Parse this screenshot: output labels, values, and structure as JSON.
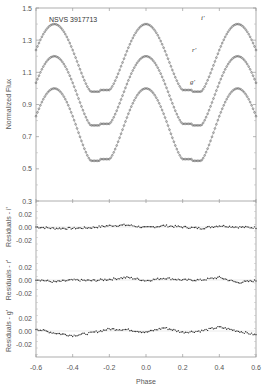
{
  "chart_data": {
    "type": "scatter",
    "annotation": "NSVS 3917713",
    "xlabel": "Phase",
    "xlim": [
      -0.6,
      0.6
    ],
    "xticks": [
      "-0.6",
      "-0.4",
      "-0.2",
      "0.0",
      "0.2",
      "0.4",
      "0.6"
    ],
    "panels": [
      {
        "name": "light-curves",
        "ylabel": "Normalized Flux",
        "ylim": [
          0.3,
          1.5
        ],
        "yticks": [
          "1.5",
          "1.3",
          "1.1",
          "0.9",
          "0.7",
          "0.5",
          "0.3"
        ],
        "series": [
          {
            "name": "i'",
            "label": "i'",
            "max_flux": 1.4,
            "min_flux_primary": 0.99,
            "min_flux_secondary": 0.98
          },
          {
            "name": "r'",
            "label": "r'",
            "max_flux": 1.2,
            "min_flux_primary": 0.78,
            "min_flux_secondary": 0.77
          },
          {
            "name": "g'",
            "label": "g'",
            "max_flux": 1.0,
            "min_flux_primary": 0.56,
            "min_flux_secondary": 0.55
          }
        ]
      },
      {
        "name": "residuals-i",
        "ylabel": "Residuals - i'",
        "yticks": [
          "0.02",
          "0.00",
          "-0.02"
        ],
        "x": [
          -0.6,
          -0.5,
          -0.4,
          -0.3,
          -0.2,
          -0.1,
          0.0,
          0.1,
          0.2,
          0.3,
          0.4,
          0.5,
          0.6
        ],
        "values": [
          0.0,
          -0.002,
          -0.002,
          -0.001,
          0.002,
          0.003,
          -0.001,
          0.002,
          0.0,
          -0.002,
          0.002,
          0.0,
          -0.001
        ]
      },
      {
        "name": "residuals-r",
        "ylabel": "Residuals - r'",
        "yticks": [
          "0.02",
          "0.00",
          "-0.02"
        ],
        "x": [
          -0.6,
          -0.5,
          -0.4,
          -0.3,
          -0.2,
          -0.1,
          0.0,
          0.1,
          0.2,
          0.3,
          0.4,
          0.5,
          0.6
        ],
        "values": [
          0.001,
          -0.003,
          0.0,
          -0.001,
          0.001,
          0.004,
          -0.001,
          0.003,
          0.0,
          0.0,
          0.004,
          -0.004,
          -0.001
        ]
      },
      {
        "name": "residuals-g",
        "ylabel": "Residuals - g'",
        "yticks": [
          "0.02",
          "0.00",
          "-0.02"
        ],
        "x": [
          -0.6,
          -0.5,
          -0.4,
          -0.3,
          -0.2,
          -0.1,
          0.0,
          0.1,
          0.2,
          0.3,
          0.4,
          0.5,
          0.6
        ],
        "values": [
          0.003,
          -0.003,
          -0.007,
          -0.003,
          0.003,
          0.002,
          -0.002,
          0.005,
          -0.002,
          0.0,
          0.006,
          0.0,
          -0.006
        ]
      }
    ]
  }
}
